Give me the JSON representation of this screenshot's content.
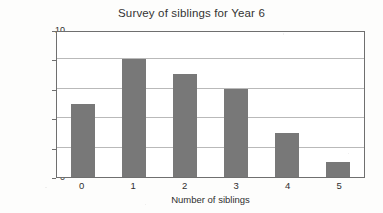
{
  "chart_data": {
    "type": "bar",
    "title": "Survey of siblings for Year 6",
    "xlabel": "Number of siblings",
    "ylabel": "Number of children",
    "categories": [
      "0",
      "1",
      "2",
      "3",
      "4",
      "5"
    ],
    "values": [
      5,
      8,
      7,
      6,
      3,
      1
    ],
    "ylim": [
      0,
      10
    ],
    "yticks": [
      "10",
      "8",
      "6",
      "4",
      "2",
      "0"
    ],
    "ytick_values": [
      10,
      8,
      6,
      4,
      2,
      0
    ],
    "gridlines": [
      2,
      4,
      6,
      8
    ],
    "grid": true,
    "legend": false,
    "bar_color": "#787878",
    "frame_color": "#6f6f6f",
    "grid_color": "#b9b9b9",
    "background": "#ffffff"
  }
}
